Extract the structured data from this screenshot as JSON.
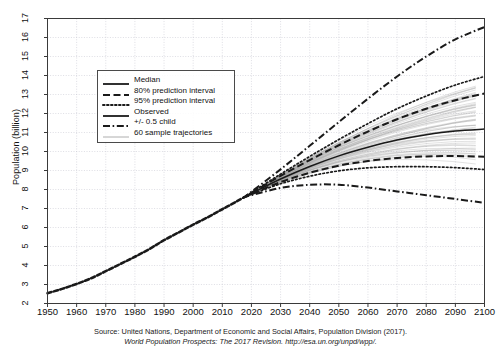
{
  "axes": {
    "ylabel": "Population (billion)",
    "yticks": [
      "2",
      "3",
      "4",
      "5",
      "6",
      "7",
      "8",
      "9",
      "10",
      "11",
      "12",
      "13",
      "14",
      "15",
      "16",
      "17"
    ],
    "xticks": [
      "1950",
      "1960",
      "1970",
      "1980",
      "1990",
      "2000",
      "2010",
      "2020",
      "2030",
      "2040",
      "2050",
      "2060",
      "2070",
      "2080",
      "2090",
      "2100"
    ]
  },
  "legend": {
    "items": [
      {
        "label": "Median",
        "style": "solid-thick"
      },
      {
        "label": "80% prediction interval",
        "style": "dashed"
      },
      {
        "label": "95% prediction interval",
        "style": "dotted"
      },
      {
        "label": "Observed",
        "style": "solid-thick"
      },
      {
        "label": "+/- 0.5 child",
        "style": "dash-dot"
      },
      {
        "label": "60 sample trajectories",
        "style": "solid-thin-gray"
      }
    ]
  },
  "caption": {
    "line1": "Source: United Nations, Department of Economic and Social Affairs, Population Division (2017).",
    "line2": "World Population Prospects: The 2017 Revision. http://esa.un.org/unpd/wpp/."
  },
  "colors": {
    "axis": "#3a3a3a",
    "grid": "#c8c8d2",
    "line": "#1a1a1a",
    "trajectory": "#9a9a9a",
    "background": "#ffffff"
  },
  "chart_data": {
    "type": "line",
    "title": "",
    "xlabel": "",
    "ylabel": "Population (billion)",
    "xlim": [
      1950,
      2100
    ],
    "ylim": [
      2,
      17
    ],
    "grid": true,
    "legend_position": "upper-left-inside",
    "series": [
      {
        "name": "Observed",
        "style": "solid-thick",
        "x": [
          1950,
          1955,
          1960,
          1965,
          1970,
          1975,
          1980,
          1985,
          1990,
          1995,
          2000,
          2005,
          2010,
          2015,
          2017
        ],
        "values": [
          2.54,
          2.77,
          3.03,
          3.33,
          3.7,
          4.08,
          4.46,
          4.87,
          5.33,
          5.74,
          6.15,
          6.54,
          6.96,
          7.38,
          7.55
        ]
      },
      {
        "name": "Median",
        "style": "solid-thick",
        "x": [
          2017,
          2020,
          2030,
          2040,
          2050,
          2060,
          2070,
          2080,
          2090,
          2100
        ],
        "values": [
          7.55,
          7.79,
          8.55,
          9.21,
          9.77,
          10.22,
          10.6,
          10.88,
          11.08,
          11.18
        ]
      },
      {
        "name": "80% prediction interval upper",
        "style": "dashed",
        "x": [
          2017,
          2020,
          2030,
          2040,
          2050,
          2060,
          2070,
          2080,
          2090,
          2100
        ],
        "values": [
          7.55,
          7.82,
          8.72,
          9.55,
          10.33,
          11.05,
          11.7,
          12.25,
          12.7,
          13.05
        ]
      },
      {
        "name": "80% prediction interval lower",
        "style": "dashed",
        "x": [
          2017,
          2020,
          2030,
          2040,
          2050,
          2060,
          2070,
          2080,
          2090,
          2100
        ],
        "values": [
          7.55,
          7.76,
          8.39,
          8.88,
          9.25,
          9.5,
          9.66,
          9.74,
          9.76,
          9.73
        ]
      },
      {
        "name": "95% prediction interval upper",
        "style": "dotted",
        "x": [
          2017,
          2020,
          2030,
          2040,
          2050,
          2060,
          2070,
          2080,
          2090,
          2100
        ],
        "values": [
          7.55,
          7.84,
          8.81,
          9.74,
          10.63,
          11.47,
          12.25,
          12.92,
          13.5,
          13.95
        ]
      },
      {
        "name": "95% prediction interval lower",
        "style": "dotted",
        "x": [
          2017,
          2020,
          2030,
          2040,
          2050,
          2060,
          2070,
          2080,
          2090,
          2100
        ],
        "values": [
          7.55,
          7.74,
          8.3,
          8.7,
          8.98,
          9.14,
          9.2,
          9.2,
          9.15,
          9.05
        ]
      },
      {
        "name": "+0.5 child",
        "style": "dash-dot",
        "x": [
          2017,
          2020,
          2030,
          2040,
          2050,
          2060,
          2070,
          2080,
          2090,
          2100
        ],
        "values": [
          7.55,
          7.88,
          9.06,
          10.3,
          11.55,
          12.78,
          13.95,
          15.0,
          15.9,
          16.55
        ]
      },
      {
        "name": "-0.5 child",
        "style": "dash-dot",
        "x": [
          2017,
          2020,
          2030,
          2040,
          2050,
          2060,
          2070,
          2080,
          2090,
          2100
        ],
        "values": [
          7.55,
          7.7,
          8.08,
          8.25,
          8.25,
          8.1,
          7.9,
          7.7,
          7.5,
          7.3
        ]
      }
    ],
    "sample_trajectories": {
      "count": 60,
      "style": "solid-thin-gray",
      "x": [
        2017,
        2030,
        2050,
        2070,
        2100
      ],
      "endpoint_range_2100": [
        9.3,
        13.6
      ]
    }
  }
}
